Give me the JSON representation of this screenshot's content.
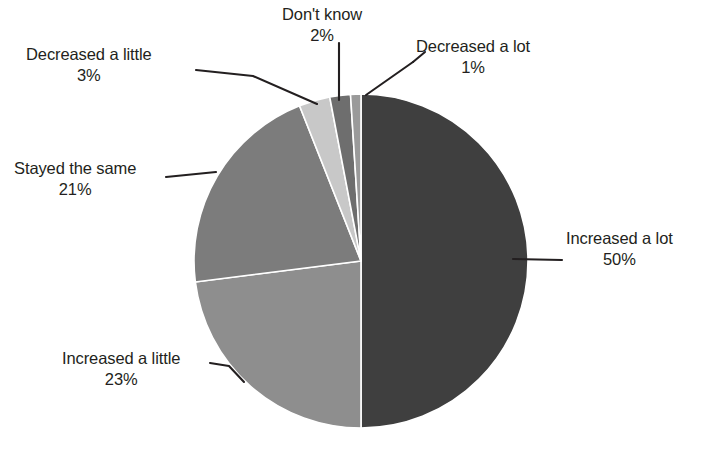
{
  "chart_data": {
    "type": "pie",
    "title": "",
    "subtitle": "",
    "xlabel": "",
    "ylabel": "",
    "legend_position": "none",
    "grid": false,
    "labels_show_percent": true,
    "start_angle_deg": 0,
    "direction": "clockwise",
    "categories": [
      "Increased a lot",
      "Increased a little",
      "Stayed the same",
      "Decreased a little",
      "Don't know",
      "Decreased a lot"
    ],
    "values": [
      50,
      23,
      21,
      3,
      2,
      1
    ],
    "value_labels": [
      "50%",
      "23%",
      "21%",
      "3%",
      "2%",
      "1%"
    ],
    "colors": [
      "#3f3f3f",
      "#8e8e8e",
      "#7c7c7c",
      "#c8c8c8",
      "#6e6e6e",
      "#9a9a9a"
    ],
    "slices": [
      {
        "name": "Increased a lot",
        "value": 50,
        "percent_label": "50%",
        "color": "#3f3f3f"
      },
      {
        "name": "Increased a little",
        "value": 23,
        "percent_label": "23%",
        "color": "#8e8e8e"
      },
      {
        "name": "Stayed the same",
        "value": 21,
        "percent_label": "21%",
        "color": "#7c7c7c"
      },
      {
        "name": "Decreased a little",
        "value": 3,
        "percent_label": "3%",
        "color": "#c8c8c8"
      },
      {
        "name": "Don't know",
        "value": 2,
        "percent_label": "2%",
        "color": "#6e6e6e"
      },
      {
        "name": "Decreased a lot",
        "value": 1,
        "percent_label": "1%",
        "color": "#9a9a9a"
      }
    ]
  },
  "labels": {
    "increased_a_lot": {
      "name": "Increased a lot",
      "percent": "50%"
    },
    "increased_a_little": {
      "name": "Increased a little",
      "percent": "23%"
    },
    "stayed_the_same": {
      "name": "Stayed the same",
      "percent": "21%"
    },
    "decreased_a_little": {
      "name": "Decreased a little",
      "percent": "3%"
    },
    "dont_know": {
      "name": "Don't know",
      "percent": "2%"
    },
    "decreased_a_lot": {
      "name": "Decreased a lot",
      "percent": "1%"
    }
  },
  "style": {
    "background": "#ffffff",
    "text_color": "#231f20",
    "leader_line_color": "#231f20",
    "slice_separator_color": "#ffffff"
  },
  "geometry": {
    "center_x": 361,
    "center_y": 261,
    "radius": 167
  }
}
